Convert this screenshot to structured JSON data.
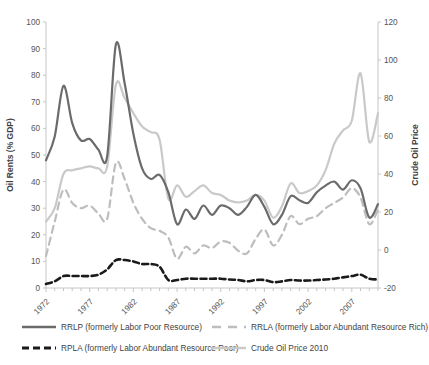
{
  "chart_data": {
    "type": "line",
    "title": "",
    "xlabel": "",
    "ylabel": "Oil Rents (% GDP)",
    "y2label": "Crude Oil Price",
    "xlim": [
      1972,
      2010
    ],
    "ylim": [
      0,
      100
    ],
    "y2lim": [
      -20,
      120
    ],
    "grid": false,
    "legend_position": "bottom",
    "xticks": [
      "1972",
      "1977",
      "1982",
      "1987",
      "1992",
      "1997",
      "2002",
      "2007"
    ],
    "xtick_values": [
      1972,
      1977,
      1982,
      1987,
      1992,
      1997,
      2002,
      2007
    ],
    "yticks": [
      "0",
      "10",
      "20",
      "30",
      "40",
      "50",
      "60",
      "70",
      "80",
      "90",
      "100"
    ],
    "ytick_values": [
      0,
      10,
      20,
      30,
      40,
      50,
      60,
      70,
      80,
      90,
      100
    ],
    "y2ticks": [
      "-20",
      "0",
      "20",
      "40",
      "60",
      "80",
      "100",
      "120"
    ],
    "y2tick_values": [
      -20,
      0,
      20,
      40,
      60,
      80,
      100,
      120
    ],
    "x": [
      1972,
      1973,
      1974,
      1975,
      1976,
      1977,
      1978,
      1979,
      1980,
      1981,
      1982,
      1983,
      1984,
      1985,
      1986,
      1987,
      1988,
      1989,
      1990,
      1991,
      1992,
      1993,
      1994,
      1995,
      1996,
      1997,
      1998,
      1999,
      2000,
      2001,
      2002,
      2003,
      2004,
      2005,
      2006,
      2007,
      2008,
      2009,
      2010
    ],
    "series": [
      {
        "name": "RRLP (formerly Labor Poor Resource)",
        "axis": "left",
        "color": "#6b6b6b",
        "style": "solid",
        "width": 2.2,
        "values": [
          48,
          57,
          76,
          62,
          55.5,
          56,
          52,
          49.5,
          91.5,
          77,
          58,
          45,
          41,
          42.5,
          36,
          24,
          29.5,
          26,
          31,
          27.5,
          31,
          30,
          27.5,
          30.5,
          35,
          30.5,
          24,
          27.5,
          34.5,
          33,
          32,
          36,
          38.5,
          40,
          37,
          40.5,
          37.5,
          26.5,
          31.5
        ]
      },
      {
        "name": "RRLA (formerly Labor Abundant Resource Rich)",
        "axis": "left",
        "color": "#bdbdbd",
        "style": "dashed",
        "width": 2.2,
        "values": [
          12,
          25,
          37,
          32,
          30,
          31,
          28,
          26,
          47,
          41,
          32,
          26,
          22.5,
          21.5,
          19,
          11,
          15.5,
          13,
          16,
          15,
          17.5,
          17,
          14,
          13,
          18.5,
          22,
          16,
          20,
          27,
          24,
          26,
          27,
          30,
          32,
          34,
          37.5,
          34,
          24,
          29.5
        ]
      },
      {
        "name": "RPLA (formerly Labor Abundant Resource Poor)",
        "axis": "left",
        "color": "#1a1a1a",
        "style": "dashed",
        "width": 2.6,
        "values": [
          1.5,
          2.5,
          4.5,
          4.5,
          4.5,
          4.5,
          5,
          7,
          10.5,
          10.5,
          10,
          9,
          9,
          8,
          3,
          3,
          3.5,
          3.5,
          3.5,
          3.5,
          3.5,
          3.2,
          3,
          2.5,
          3,
          3,
          2.2,
          2.5,
          3,
          2.8,
          2.8,
          3,
          3.2,
          3.5,
          4,
          4.5,
          5,
          3.5,
          3.2
        ]
      },
      {
        "name": "Crude Oil Price 2010",
        "axis": "right",
        "color": "#c9c9c9",
        "style": "solid",
        "width": 2.2,
        "values": [
          15,
          22,
          40,
          42,
          43,
          44,
          43,
          44,
          87,
          80,
          72,
          65,
          62,
          58,
          27,
          34,
          28,
          31,
          34,
          30,
          29,
          26,
          25,
          26,
          29,
          26,
          17,
          23,
          35,
          30,
          31,
          34,
          42,
          56,
          63,
          68,
          93,
          57,
          72
        ]
      }
    ]
  },
  "legend": {
    "items": [
      {
        "label": "RRLP (formerly Labor Poor Resource)",
        "marker": "solid-dark-line",
        "color": "#6b6b6b"
      },
      {
        "label": "RRLA (formerly Labor Abundant Resource Rich)",
        "marker": "dashed-light-line",
        "color": "#bdbdbd"
      },
      {
        "label": "RPLA (formerly Labor Abundant Resource Poor)",
        "marker": "dashed-black-line",
        "color": "#1a1a1a"
      },
      {
        "label": "Crude Oil Price 2010",
        "marker": "solid-light-line",
        "color": "#c9c9c9"
      }
    ]
  },
  "axes": {
    "left_title": "Oil Rents (% GDP)",
    "right_title": "Crude Oil Price"
  }
}
